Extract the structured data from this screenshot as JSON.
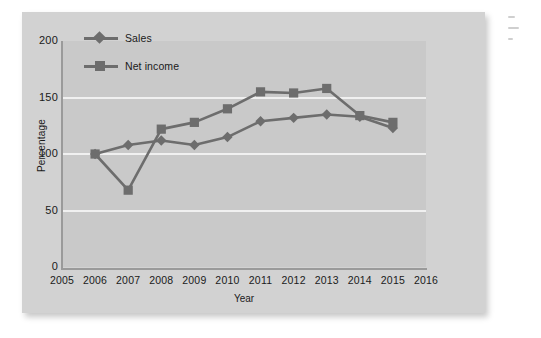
{
  "figure": {
    "background_color": "#d2d2d2",
    "plot_background_color": "#c9c9c9",
    "series_color": "#6d6d6d",
    "gridline_color": "#f0f0f0",
    "axis_color": "#9a9a9a"
  },
  "legend": {
    "position": "top-left-inside",
    "items": [
      {
        "label": "Sales",
        "marker": "diamond-marker"
      },
      {
        "label": "Net income",
        "marker": "square-marker"
      }
    ]
  },
  "axes": {
    "y_title": "Percentage",
    "x_title": "Year",
    "y_ticks": [
      "0",
      "50",
      "100",
      "150",
      "200"
    ],
    "x_ticks": [
      "2005",
      "2006",
      "2007",
      "2008",
      "2009",
      "2010",
      "2011",
      "2012",
      "2013",
      "2014",
      "2015",
      "2016"
    ]
  },
  "chart_data": {
    "type": "line",
    "title": "",
    "xlabel": "Year",
    "ylabel": "Percentage",
    "x": [
      2006,
      2007,
      2008,
      2009,
      2010,
      2011,
      2012,
      2013,
      2014,
      2015
    ],
    "categories": [
      "2006",
      "2007",
      "2008",
      "2009",
      "2010",
      "2011",
      "2012",
      "2013",
      "2014",
      "2015"
    ],
    "series": [
      {
        "name": "Sales",
        "marker": "diamond",
        "color": "#6d6d6d",
        "values": [
          100,
          108,
          112,
          108,
          115,
          129,
          132,
          135,
          133,
          123
        ]
      },
      {
        "name": "Net income",
        "marker": "square",
        "color": "#6d6d6d",
        "values": [
          100,
          68,
          122,
          128,
          140,
          155,
          154,
          158,
          134,
          128
        ]
      }
    ],
    "xlim": [
      2005,
      2016
    ],
    "ylim": [
      0,
      200
    ],
    "ytick_values": [
      0,
      50,
      100,
      150,
      200
    ],
    "xtick_values": [
      2005,
      2006,
      2007,
      2008,
      2009,
      2010,
      2011,
      2012,
      2013,
      2014,
      2015,
      2016
    ],
    "grid": "horizontal",
    "legend_position": "upper left"
  }
}
